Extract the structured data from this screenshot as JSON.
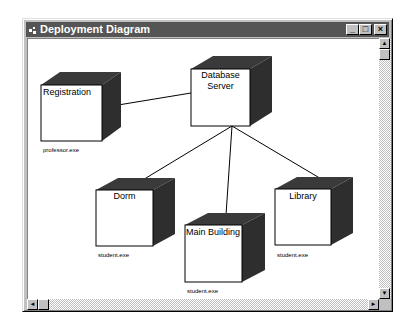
{
  "window": {
    "title": "Deployment Diagram",
    "controls": {
      "minimize": "_",
      "maximize": "□",
      "close": "×"
    }
  },
  "colors": {
    "titlebar": "#555555",
    "node_front": "#ffffff",
    "node_top": "#3a3a3a",
    "node_side": "#2e2e2e",
    "connector": "#000000"
  },
  "diagram": {
    "nodes": [
      {
        "id": "registration",
        "label": "Registration",
        "artifact": "professor.exe"
      },
      {
        "id": "database-server",
        "label": "Database Server",
        "label_lines": [
          "Database",
          "Server"
        ],
        "artifact": ""
      },
      {
        "id": "dorm",
        "label": "Dorm",
        "artifact": "student.exe"
      },
      {
        "id": "main-building",
        "label": "Main Building",
        "artifact": "student.exe"
      },
      {
        "id": "library",
        "label": "Library",
        "artifact": "student.exe"
      }
    ],
    "connections": [
      {
        "from": "registration",
        "to": "database-server"
      },
      {
        "from": "database-server",
        "to": "dorm"
      },
      {
        "from": "database-server",
        "to": "main-building"
      },
      {
        "from": "database-server",
        "to": "library"
      }
    ]
  },
  "scrollbars": {
    "up": "▲",
    "down": "▼",
    "left": "◄",
    "right": "►"
  }
}
